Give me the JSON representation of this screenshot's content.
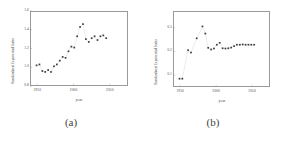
{
  "figure": {
    "caption_a": "(a)",
    "caption_b": "(b)"
  },
  "chart_data": [
    {
      "panel": "a",
      "type": "scatter",
      "title": "",
      "xlabel": "year",
      "ylabel": "Standardized Exponential Index",
      "xlim": [
        1940,
        2075
      ],
      "ylim": [
        0.8,
        1.6
      ],
      "xticks": [
        1950,
        2000,
        2050
      ],
      "xticklabels": [
        "1950",
        "2000",
        "2050"
      ],
      "yticks": [
        0.8,
        1.0,
        1.2,
        1.4,
        1.6
      ],
      "yticklabels": [
        "0.8",
        "1.0",
        "1.2",
        "1.4",
        "1.6"
      ],
      "grid": false,
      "legend": "none",
      "marker": "square",
      "x": [
        1949,
        1953,
        1957,
        1961,
        1965,
        1969,
        1973,
        1977,
        1981,
        1985,
        1989,
        1993,
        1997,
        2001,
        2005,
        2009,
        2013,
        2017,
        2021,
        2025,
        2029,
        2033,
        2037,
        2041,
        2045
      ],
      "y": [
        1.02,
        1.03,
        0.96,
        0.95,
        0.97,
        0.95,
        1.01,
        1.03,
        1.07,
        1.11,
        1.1,
        1.17,
        1.22,
        1.21,
        1.33,
        1.43,
        1.46,
        1.3,
        1.27,
        1.31,
        1.33,
        1.29,
        1.33,
        1.34,
        1.31
      ]
    },
    {
      "panel": "b",
      "type": "scatter",
      "title": "",
      "xlabel": "year",
      "ylabel": "Standardized Exponential Index",
      "xlim": [
        1940,
        2075
      ],
      "ylim": [
        0.05,
        0.37
      ],
      "xticks": [
        1950,
        2000,
        2050
      ],
      "xticklabels": [
        "1950",
        "2000",
        "2050"
      ],
      "yticks": [
        0.1,
        0.2,
        0.3
      ],
      "yticklabels": [
        "0.1",
        "0.2",
        "0.3"
      ],
      "grid": false,
      "legend": "none",
      "marker": "square",
      "x": [
        1949,
        1953,
        1961,
        1965,
        1973,
        1981,
        1985,
        1989,
        1993,
        1997,
        2001,
        2005,
        2009,
        2013,
        2017,
        2021,
        2025,
        2029,
        2033,
        2037,
        2041,
        2045,
        2049,
        2053
      ],
      "y": [
        0.085,
        0.085,
        0.205,
        0.195,
        0.255,
        0.305,
        0.275,
        0.215,
        0.208,
        0.212,
        0.228,
        0.236,
        0.213,
        0.212,
        0.213,
        0.216,
        0.222,
        0.228,
        0.228,
        0.229,
        0.228,
        0.228,
        0.228,
        0.228
      ]
    }
  ]
}
